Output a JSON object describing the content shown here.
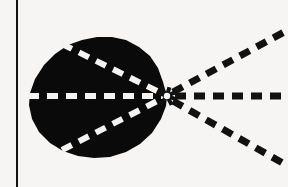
{
  "figure": {
    "title": "Converging and diverging dashed rays at the apex of a dark lobed region",
    "canvas": {
      "width": 288,
      "height": 187,
      "background_color": "#f6f5f3"
    },
    "colors": {
      "background": "#f6f5f3",
      "blob_fill": "#0a0a0a",
      "ray_dark": "#111111",
      "ray_light": "#f4f3f1",
      "border_line": "#141414"
    },
    "axis_border": {
      "label": "vertical border line",
      "orientation": "vertical",
      "x": 17,
      "y_start": 0,
      "y_end": 187,
      "thickness": 2,
      "color": "#141414"
    },
    "blob": {
      "label": "dark lobed region",
      "fill_color": "#0a0a0a",
      "bounds": {
        "left": 28,
        "top": 37,
        "right": 170,
        "bottom": 158
      },
      "center": {
        "x": 95,
        "y": 97
      },
      "apex": {
        "x": 167,
        "y": 96
      },
      "outline_points": [
        [
          167,
          96
        ],
        [
          163,
          82
        ],
        [
          158,
          68
        ],
        [
          150,
          56
        ],
        [
          139,
          47
        ],
        [
          126,
          40
        ],
        [
          112,
          37
        ],
        [
          97,
          37
        ],
        [
          82,
          40
        ],
        [
          68,
          45
        ],
        [
          55,
          54
        ],
        [
          44,
          65
        ],
        [
          35,
          79
        ],
        [
          30,
          93
        ],
        [
          29,
          105
        ],
        [
          32,
          119
        ],
        [
          39,
          132
        ],
        [
          50,
          143
        ],
        [
          63,
          151
        ],
        [
          78,
          156
        ],
        [
          94,
          158
        ],
        [
          110,
          157
        ],
        [
          126,
          152
        ],
        [
          140,
          144
        ],
        [
          152,
          133
        ],
        [
          161,
          119
        ],
        [
          166,
          106
        ]
      ]
    },
    "focal_point": {
      "label": "convergence point",
      "x": 167,
      "y": 96,
      "marker": "starburst"
    },
    "rays": [
      {
        "id": "incoming-axis",
        "label": "horizontal axis ray inside region",
        "style": "dashed",
        "color": "#f4f3f1",
        "dash_length": 11,
        "gap_length": 8,
        "thickness": 6,
        "from": {
          "x": 28,
          "y": 96
        },
        "to": {
          "x": 167,
          "y": 96
        }
      },
      {
        "id": "incoming-upper",
        "label": "upper chord ray inside region",
        "style": "dashed",
        "color": "#f4f3f1",
        "dash_length": 11,
        "gap_length": 8,
        "thickness": 6,
        "from": {
          "x": 62,
          "y": 44
        },
        "to": {
          "x": 167,
          "y": 96
        }
      },
      {
        "id": "incoming-lower",
        "label": "lower chord ray inside region",
        "style": "dashed",
        "color": "#f4f3f1",
        "dash_length": 11,
        "gap_length": 8,
        "thickness": 6,
        "from": {
          "x": 62,
          "y": 150
        },
        "to": {
          "x": 167,
          "y": 96
        }
      },
      {
        "id": "outgoing-axis",
        "label": "horizontal outgoing ray",
        "style": "dashed",
        "color": "#111111",
        "dash_length": 11,
        "gap_length": 8,
        "thickness": 7,
        "from": {
          "x": 175,
          "y": 96
        },
        "to": {
          "x": 288,
          "y": 96
        }
      },
      {
        "id": "outgoing-upper",
        "label": "upper diverging ray",
        "style": "dashed",
        "color": "#111111",
        "dash_length": 11,
        "gap_length": 8,
        "thickness": 7,
        "from": {
          "x": 173,
          "y": 92
        },
        "to": {
          "x": 288,
          "y": 30
        }
      },
      {
        "id": "outgoing-lower",
        "label": "lower diverging ray",
        "style": "dashed",
        "color": "#111111",
        "dash_length": 11,
        "gap_length": 8,
        "thickness": 7,
        "from": {
          "x": 173,
          "y": 101
        },
        "to": {
          "x": 288,
          "y": 166
        }
      }
    ],
    "starburst_spokes": [
      {
        "angle_deg": 200,
        "length": 10
      },
      {
        "angle_deg": 232,
        "length": 11
      },
      {
        "angle_deg": 285,
        "length": 9
      },
      {
        "angle_deg": 335,
        "length": 11
      },
      {
        "angle_deg": 20,
        "length": 11
      },
      {
        "angle_deg": 62,
        "length": 10
      },
      {
        "angle_deg": 128,
        "length": 11
      }
    ]
  }
}
